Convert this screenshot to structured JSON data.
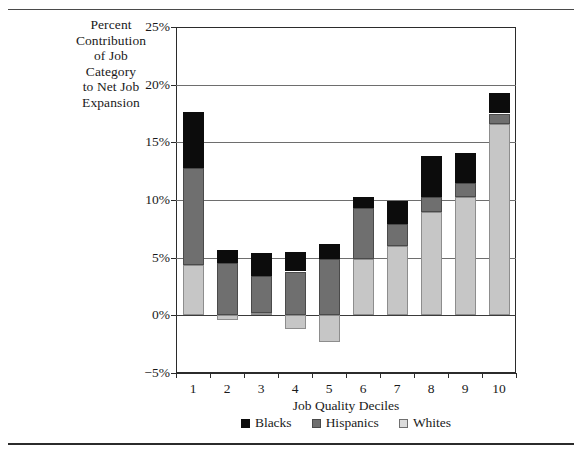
{
  "figure": {
    "y_axis_title_lines": [
      "Percent",
      "Contribution",
      "of Job",
      "Category",
      "to Net Job",
      "Expansion"
    ],
    "x_axis_title": "Job Quality Deciles"
  },
  "legend": {
    "position": "bottom-center",
    "items": [
      {
        "label": "Blacks",
        "color": "#0c0c0c",
        "key": "blacks"
      },
      {
        "label": "Hispanics",
        "color": "#6f6f6f",
        "key": "hispanics"
      },
      {
        "label": "Whites",
        "color": "#dcdcdc",
        "key": "whites"
      }
    ]
  },
  "chart_data": {
    "type": "bar",
    "stacked": true,
    "title": "",
    "subtitle": "",
    "xlabel": "Job Quality Deciles",
    "ylabel": "Percent Contribution of Job Category to Net Job Expansion",
    "categories": [
      "1",
      "2",
      "3",
      "4",
      "5",
      "6",
      "7",
      "8",
      "9",
      "10"
    ],
    "ylim": [
      -5,
      25
    ],
    "yticks": [
      -5,
      0,
      5,
      10,
      15,
      20,
      25
    ],
    "ytick_labels": [
      "−5%",
      "0%",
      "5%",
      "10%",
      "15%",
      "20%",
      "25%"
    ],
    "grid": true,
    "grid_axis": "y",
    "series": [
      {
        "name": "Whites",
        "color": "#c6c6c6",
        "values": [
          4.4,
          -0.4,
          0.2,
          -1.2,
          -2.3,
          4.9,
          6.0,
          9.0,
          10.3,
          16.6
        ]
      },
      {
        "name": "Hispanics",
        "color": "#6f6f6f",
        "values": [
          8.4,
          4.5,
          3.2,
          3.8,
          4.9,
          4.4,
          1.9,
          1.3,
          1.2,
          0.9
        ]
      },
      {
        "name": "Blacks",
        "color": "#0c0c0c",
        "values": [
          4.8,
          1.2,
          2.0,
          1.7,
          1.3,
          1.0,
          2.0,
          3.5,
          2.6,
          1.8
        ]
      }
    ],
    "stack_totals": [
      17.6,
      5.6,
      5.4,
      4.3,
      3.9,
      10.3,
      9.9,
      13.8,
      14.1,
      19.3
    ]
  }
}
